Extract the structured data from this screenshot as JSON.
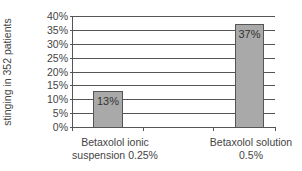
{
  "chart_data": {
    "type": "bar",
    "title": "",
    "xlabel": "",
    "ylabel": "Incidence of burning and stinging in 352 patients",
    "ylabel_lines": [
      "Incidence of burning and",
      "stinging in 352 patients"
    ],
    "categories": [
      "Betaxolol ionic suspension 0.25%",
      "Betaxolol solution 0.5%"
    ],
    "category_lines": [
      [
        "Betaxolol ionic",
        "suspension 0.25%"
      ],
      [
        "Betaxolol solution",
        "0.5%"
      ]
    ],
    "values": [
      13,
      37
    ],
    "data_labels": [
      "13%",
      "37%"
    ],
    "unit": "%",
    "ylim": [
      0,
      40
    ],
    "yticks": [
      "40%",
      "35%",
      "30%",
      "25%",
      "20%",
      "15%",
      "10%",
      "5%",
      "0%"
    ],
    "grid": true,
    "legend": null
  },
  "colors": {
    "bar_fill": "#a9a9a9",
    "bar_border": "#555555",
    "gridline": "#555555",
    "text": "#444444"
  }
}
